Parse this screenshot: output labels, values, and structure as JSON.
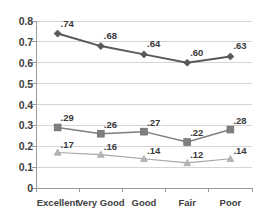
{
  "chart_data": {
    "type": "line",
    "title": "",
    "xlabel": "",
    "ylabel": "",
    "categories": [
      "Excellent",
      "Very Good",
      "Good",
      "Fair",
      "Poor"
    ],
    "ylim": [
      0,
      0.8
    ],
    "ytick_labels": [
      "0.8",
      "0.7",
      "0.6",
      "0.5",
      "0.4",
      "0.3",
      "0.2",
      "0.1",
      "0"
    ],
    "ytick_values": [
      0.8,
      0.7,
      0.6,
      0.5,
      0.4,
      0.3,
      0.2,
      0.1,
      0
    ],
    "grid": "horizontal",
    "legend": "none",
    "series": [
      {
        "name": "series-1",
        "marker": "diamond",
        "color": "#595959",
        "values": [
          0.74,
          0.68,
          0.64,
          0.6,
          0.63
        ],
        "labels": [
          ".74",
          ".68",
          ".64",
          ".60",
          ".63"
        ]
      },
      {
        "name": "series-2",
        "marker": "square",
        "color": "#7f7f7f",
        "values": [
          0.29,
          0.26,
          0.27,
          0.22,
          0.28
        ],
        "labels": [
          ".29",
          ".26",
          ".27",
          ".22",
          ".28"
        ]
      },
      {
        "name": "series-3",
        "marker": "triangle",
        "color": "#a6a6a6",
        "values": [
          0.17,
          0.16,
          0.14,
          0.12,
          0.14
        ],
        "labels": [
          ".17",
          ".16",
          ".14",
          ".12",
          ".14"
        ]
      }
    ]
  },
  "axis": {
    "line_color": "#9a9a9a",
    "grid_color": "#d4d4d4"
  }
}
